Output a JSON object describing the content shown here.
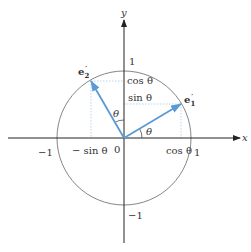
{
  "diagram": {
    "type": "unit-circle-rotation",
    "axes": {
      "x_label": "x",
      "y_label": "y",
      "origin_label": "0"
    },
    "ticks": {
      "x_neg_one": "−1",
      "x_pos_one": "1",
      "y_pos_one": "1",
      "y_neg_one": "−1"
    },
    "projection_labels": {
      "cos_x": "cos θ",
      "neg_sin_x": "− sin θ",
      "cos_y": "cos θ",
      "sin_y": "sin θ"
    },
    "angle_labels": {
      "theta_x": "θ",
      "theta_y": "θ"
    },
    "vectors": [
      {
        "name": "e1-prime",
        "label_base": "e",
        "label_sub": "1",
        "label_prime": "′",
        "color": "#5b9bd5"
      },
      {
        "name": "e2-prime",
        "label_base": "e",
        "label_sub": "2",
        "label_prime": "′",
        "color": "#5b9bd5"
      }
    ],
    "colors": {
      "axis": "#222222",
      "circle": "#555555",
      "vector": "#5b9bd5",
      "dotted": "#9ec3e6"
    }
  }
}
